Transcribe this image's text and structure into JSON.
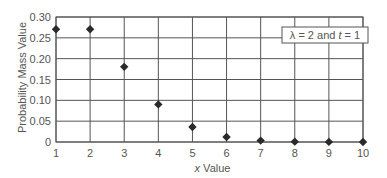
{
  "chart_data": {
    "type": "scatter",
    "title": "",
    "xlabel": "x Value",
    "ylabel": "Probability Mass Value",
    "x": [
      1,
      2,
      3,
      4,
      5,
      6,
      7,
      8,
      9,
      10
    ],
    "series": [
      {
        "name": "λ = 2 and t = 1",
        "values": [
          0.2707,
          0.2707,
          0.1804,
          0.0902,
          0.0361,
          0.012,
          0.0034,
          0.0009,
          0.0002,
          4e-05
        ]
      }
    ],
    "xticks": [
      "1",
      "2",
      "3",
      "4",
      "5",
      "6",
      "7",
      "8",
      "9",
      "10"
    ],
    "yticks": [
      "0",
      "0.05",
      "0.10",
      "0.15",
      "0.20",
      "0.25",
      "0.30"
    ],
    "xlim": [
      1,
      10
    ],
    "ylim": [
      0,
      0.3
    ],
    "grid": true,
    "legend": {
      "text_lambda": "λ = 2 and ",
      "text_t": "t",
      "text_rest": " = 1",
      "position": "upper-right"
    },
    "marker": "diamond",
    "colors": {
      "marker": "#2a2a2a",
      "grid": "#555555"
    }
  }
}
